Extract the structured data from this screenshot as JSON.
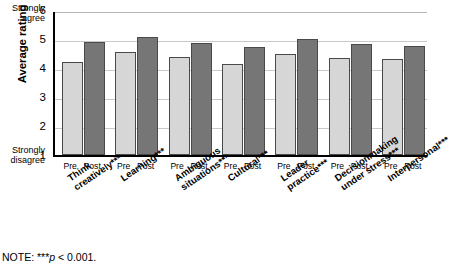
{
  "chart_data": {
    "type": "bar",
    "title": "",
    "xlabel": "",
    "ylabel": "Average rating",
    "ylim": [
      1,
      6
    ],
    "yticks": [
      1,
      2,
      3,
      4,
      5,
      6
    ],
    "grid": true,
    "legend_position": "none",
    "axis_anchor_high": "Strongly agree",
    "axis_anchor_low": "Strongly disagree",
    "categories": [
      "Think creatively***",
      "Learning***",
      "Ambiguous situations***",
      "Cultural***",
      "Leader practice***",
      "Decisionmaking under stress***",
      "Interpersonal***"
    ],
    "subgroup_labels": [
      "Pre",
      "Post"
    ],
    "series": [
      {
        "name": "Pre",
        "values": [
          4.22,
          4.55,
          4.38,
          4.13,
          4.5,
          4.33,
          4.31
        ]
      },
      {
        "name": "Post",
        "values": [
          4.9,
          5.08,
          4.85,
          4.73,
          5.0,
          4.82,
          4.75
        ]
      }
    ],
    "colors": {
      "pre": "#d6d6d6",
      "post": "#767676",
      "bar_border": "#4a4a4a",
      "grid": "#c9c9c9",
      "axis": "#000000"
    },
    "annotations": [
      "NOTE: ***p < 0.001."
    ]
  },
  "axis": {
    "y_label": "Average rating",
    "anchor_high_line1": "Strongly",
    "anchor_high_line2": "agree",
    "anchor_low_line1": "Strongly",
    "anchor_low_line2": "disagree",
    "ticks": [
      "6",
      "5",
      "4",
      "3",
      "2",
      "1"
    ]
  },
  "categories": [
    {
      "line1": "Think",
      "line2": "creatively***"
    },
    {
      "line1": "Learning***",
      "line2": ""
    },
    {
      "line1": "Ambiguous",
      "line2": "situations***"
    },
    {
      "line1": "Cultural***",
      "line2": ""
    },
    {
      "line1": "Leader",
      "line2": "practice***"
    },
    {
      "line1": "Decisionmaking",
      "line2": "under stress***"
    },
    {
      "line1": "Interpersonal***",
      "line2": ""
    }
  ],
  "tick_labels": {
    "pre": "Pre",
    "post": "Post"
  },
  "note": {
    "prefix": "NOTE: ***",
    "stat": "p",
    "suffix": " < 0.001."
  }
}
